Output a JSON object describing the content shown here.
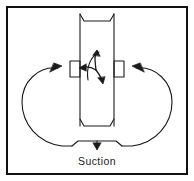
{
  "figure": {
    "name": "pump-recirculation-flow-diagram",
    "type": "technical-line-diagram",
    "background_color": "#ffffff",
    "line_color": "#1a1a1a",
    "border": {
      "name": "figure-border",
      "color": "#111111",
      "width_px": 2,
      "x": 6,
      "y": 6,
      "width": 182,
      "height": 169
    },
    "labels": {
      "suction": "Suction"
    },
    "elements": {
      "impeller_band": {
        "name": "vertical-impeller-band",
        "description": "vertical open-ended band (shroud) running top to bottom of figure",
        "x_left": 78,
        "x_right": 116,
        "y_top": 14,
        "y_bottom": 126
      },
      "hub_blocks": {
        "name": "bearing-hub-blocks",
        "count": 2,
        "left_x": 70,
        "right_x": 116,
        "y": 60,
        "width": 9,
        "height": 17
      },
      "rotation_symbol": {
        "name": "rotation-arrows",
        "center_x": 97,
        "center_y": 70,
        "arrow_count": 3
      },
      "flow_loops": [
        {
          "name": "left-recirculation-loop",
          "direction": "clockwise-inward",
          "arrow_direction": "right"
        },
        {
          "name": "right-recirculation-loop",
          "direction": "counterclockwise-inward",
          "arrow_direction": "left"
        }
      ],
      "suction_throat": {
        "name": "suction-inlet-throat",
        "x": 97,
        "y": 146,
        "arrow_direction": "down"
      }
    }
  }
}
